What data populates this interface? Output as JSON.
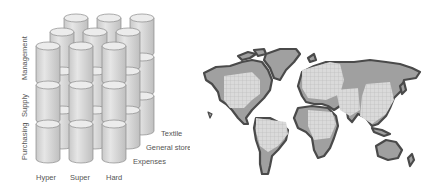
{
  "cube_diagram": {
    "vertical_axis_labels": [
      "Purchasing",
      "Supply",
      "Management"
    ],
    "horizontal_axis_labels": [
      "Hyper",
      "Super",
      "Hard"
    ],
    "depth_axis_labels": [
      "Expenses",
      "General store",
      "Textile"
    ],
    "rows": 3,
    "columns": 3,
    "layers": 3,
    "colors": {
      "cylinder_fill": "#dcdcdc",
      "cylinder_stroke": "#8a8a8a",
      "cylinder_top": "#ececec",
      "label": "#555555"
    }
  },
  "world_map": {
    "description": "grayscale world map with grid-pattern highlighted regions",
    "colors": {
      "coast": "#4a4a4a",
      "land": "#9a9a9a",
      "grid_region": "#d8d8d8",
      "grid_line": "#bdbdbd"
    }
  }
}
